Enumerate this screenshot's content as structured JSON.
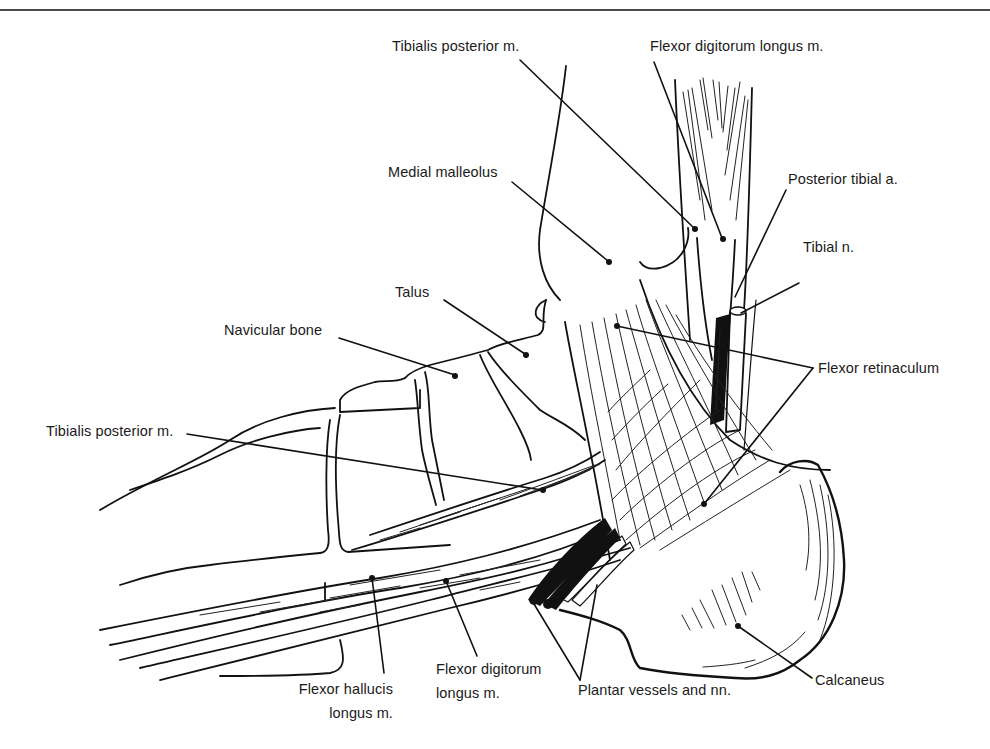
{
  "figure": {
    "type": "anatomical-illustration",
    "rule_color": "#4a4a4a",
    "ink_color": "#111111",
    "background": "#ffffff"
  },
  "labels": {
    "tibialis_posterior_top": "Tibialis posterior m.",
    "flexor_digitorum_longus_top": "Flexor digitorum longus m.",
    "medial_malleolus": "Medial malleolus",
    "posterior_tibial_artery": "Posterior tibial a.",
    "tibial_nerve": "Tibial n.",
    "talus": "Talus",
    "navicular_bone": "Navicular bone",
    "flexor_retinaculum": "Flexor retinaculum",
    "tibialis_posterior_left": "Tibialis posterior m.",
    "flexor_hallucis_longus_line1": "Flexor hallucis",
    "flexor_hallucis_longus_line2": "longus m.",
    "flexor_digitorum_longus_bottom_line1": "Flexor digitorum",
    "flexor_digitorum_longus_bottom_line2": "longus m.",
    "plantar_vessels": "Plantar vessels and nn.",
    "calcaneus": "Calcaneus"
  }
}
